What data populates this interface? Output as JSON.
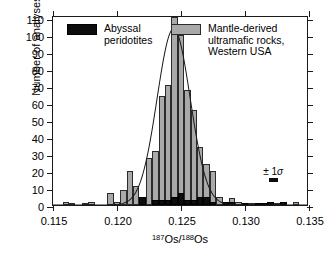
{
  "chart_data": {
    "type": "bar",
    "title": "",
    "subtitle": "",
    "xlabel": "187Os/188Os",
    "xlabel_numerator": "187",
    "xlabel_element1": "Os/",
    "xlabel_denominator": "188",
    "xlabel_element2": "Os",
    "ylabel": "Number of analyses",
    "xlim": [
      0.115,
      0.135
    ],
    "ylim": [
      0,
      112
    ],
    "bin_width": 0.0005,
    "grid": false,
    "legend_position": "top",
    "xticks": [
      "0.115",
      "0.120",
      "0.125",
      "0.130",
      "0.135"
    ],
    "xtick_values": [
      0.115,
      0.12,
      0.125,
      0.13,
      0.135
    ],
    "yticks": [
      "0",
      "10",
      "20",
      "30",
      "40",
      "50",
      "60",
      "70",
      "80",
      "90",
      "100",
      "110"
    ],
    "ytick_values": [
      0,
      10,
      20,
      30,
      40,
      50,
      60,
      70,
      80,
      90,
      100,
      110
    ],
    "series": [
      {
        "name": "Mantle-derived ultramafic rocks, Western USA",
        "color": "#a9a9a9",
        "x": [
          0.116,
          0.1165,
          0.1175,
          0.118,
          0.1195,
          0.12,
          0.1205,
          0.121,
          0.1215,
          0.122,
          0.1225,
          0.123,
          0.1235,
          0.124,
          0.1245,
          0.125,
          0.1255,
          0.126,
          0.1265,
          0.127,
          0.1275,
          0.128,
          0.1285,
          0.129,
          0.1295,
          0.13,
          0.1305,
          0.1325,
          0.134
        ],
        "values": [
          2,
          1,
          1,
          2,
          7,
          2,
          9,
          20,
          11,
          5,
          28,
          32,
          64,
          71,
          111,
          100,
          68,
          56,
          34,
          24,
          20,
          5,
          2,
          4,
          2,
          1,
          1,
          1,
          2
        ]
      },
      {
        "name": "Abyssal peridotites",
        "color": "#0d0d0d",
        "x": [
          0.122,
          0.123,
          0.1235,
          0.124,
          0.1245,
          0.125,
          0.1255,
          0.126,
          0.1265,
          0.127,
          0.1275,
          0.1285,
          0.129,
          0.13,
          0.131,
          0.1315,
          0.132,
          0.133
        ],
        "values": [
          5,
          3,
          3,
          3,
          5,
          7,
          3,
          3,
          5,
          5,
          2,
          2,
          2,
          1,
          1,
          1,
          2,
          2
        ]
      }
    ],
    "overlay_curve": {
      "name": "gaussian-fit",
      "type": "line",
      "color": "#1a1a1a",
      "peak_value": 105,
      "peak_x": 0.1245,
      "sigma": 0.0013
    },
    "annotations": [
      {
        "name": "error-bar",
        "label_prefix": "±",
        "label_value": "1",
        "label_symbol": "σ",
        "x": 0.1322,
        "y": 16
      }
    ]
  },
  "legend": {
    "abyssal": {
      "label": "Abyssal\nperidotites",
      "swatch_color": "#0d0d0d",
      "swatch_name": "black-swatch"
    },
    "mantle": {
      "label": "Mantle-derived\nultramafic rocks,\nWestern USA",
      "swatch_color": "#a9a9a9",
      "swatch_name": "grey-swatch"
    }
  },
  "sigma_annotation": {
    "text": "± 1σ"
  }
}
